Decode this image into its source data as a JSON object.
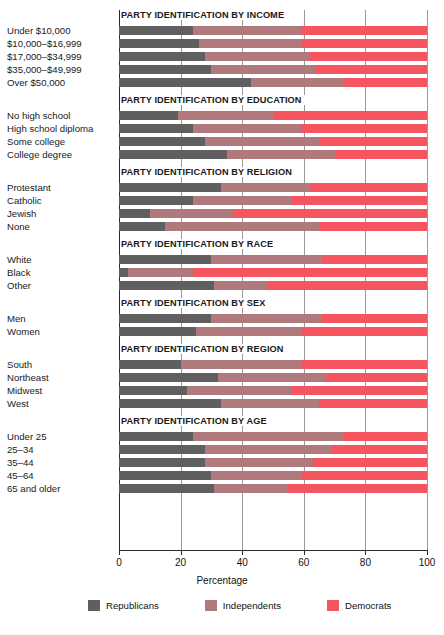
{
  "chart_data": {
    "type": "bar",
    "orientation": "horizontal",
    "stacked": true,
    "title": "",
    "xlabel": "Percentage",
    "ylabel": "",
    "xlim": [
      0,
      100
    ],
    "xticks": [
      0,
      20,
      40,
      60,
      80,
      100
    ],
    "xticklabels": [
      "0",
      "20",
      "40",
      "60",
      "80",
      "100"
    ],
    "grid": "vertical",
    "legend_position": "bottom",
    "legend": [
      "Republicans",
      "Independents",
      "Democrats"
    ],
    "colors": {
      "republicans": "#5f5f5f",
      "independents": "#b07a7d",
      "democrats": "#f4555f"
    },
    "series": [
      {
        "name": "Republicans",
        "key": "republicans"
      },
      {
        "name": "Independents",
        "key": "independents"
      },
      {
        "name": "Democrats",
        "key": "democrats"
      }
    ],
    "panels": [
      {
        "title": "PARTY IDENTIFICATION BY INCOME",
        "categories": [
          "Under $10,000",
          "$10,000–$16,999",
          "$17,000–$34,999",
          "$35,000–$49,999",
          "Over $50,000"
        ],
        "values": [
          {
            "republicans": 24,
            "independents": 35,
            "democrats": 41
          },
          {
            "republicans": 26,
            "independents": 33,
            "democrats": 41
          },
          {
            "republicans": 28,
            "independents": 34,
            "democrats": 38
          },
          {
            "republicans": 30,
            "independents": 34,
            "democrats": 36
          },
          {
            "republicans": 43,
            "independents": 30,
            "democrats": 27
          }
        ]
      },
      {
        "title": "PARTY IDENTIFICATION BY EDUCATION",
        "categories": [
          "No high school",
          "High school diploma",
          "Some college",
          "College degree"
        ],
        "values": [
          {
            "republicans": 19,
            "independents": 31,
            "democrats": 50
          },
          {
            "republicans": 24,
            "independents": 35,
            "democrats": 41
          },
          {
            "republicans": 28,
            "independents": 37,
            "democrats": 35
          },
          {
            "republicans": 35,
            "independents": 35,
            "democrats": 30
          }
        ]
      },
      {
        "title": "PARTY IDENTIFICATION BY RELIGION",
        "categories": [
          "Protestant",
          "Catholic",
          "Jewish",
          "None"
        ],
        "values": [
          {
            "republicans": 33,
            "independents": 29,
            "democrats": 38
          },
          {
            "republicans": 24,
            "independents": 32,
            "democrats": 44
          },
          {
            "republicans": 10,
            "independents": 27,
            "democrats": 63
          },
          {
            "republicans": 15,
            "independents": 50,
            "democrats": 35
          }
        ]
      },
      {
        "title": "PARTY IDENTIFICATION BY RACE",
        "categories": [
          "White",
          "Black",
          "Other"
        ],
        "values": [
          {
            "republicans": 30,
            "independents": 36,
            "democrats": 34
          },
          {
            "republicans": 3,
            "independents": 21,
            "democrats": 76
          },
          {
            "republicans": 31,
            "independents": 17,
            "democrats": 52
          }
        ]
      },
      {
        "title": "PARTY IDENTIFICATION BY SEX",
        "categories": [
          "Men",
          "Women"
        ],
        "values": [
          {
            "republicans": 30,
            "independents": 36,
            "democrats": 34
          },
          {
            "republicans": 25,
            "independents": 34,
            "democrats": 41
          }
        ]
      },
      {
        "title": "PARTY IDENTIFICATION BY REGION",
        "categories": [
          "South",
          "Northeast",
          "Midwest",
          "West"
        ],
        "values": [
          {
            "republicans": 20,
            "independents": 39,
            "democrats": 41
          },
          {
            "republicans": 32,
            "independents": 35,
            "democrats": 33
          },
          {
            "republicans": 22,
            "independents": 34,
            "democrats": 44
          },
          {
            "republicans": 33,
            "independents": 32,
            "democrats": 35
          }
        ]
      },
      {
        "title": "PARTY IDENTIFICATION BY AGE",
        "categories": [
          "Under 25",
          "25–34",
          "35–44",
          "45–64",
          "65 and older"
        ],
        "values": [
          {
            "republicans": 24,
            "independents": 49,
            "democrats": 27
          },
          {
            "republicans": 28,
            "independents": 41,
            "democrats": 31
          },
          {
            "republicans": 28,
            "independents": 35,
            "democrats": 37
          },
          {
            "republicans": 30,
            "independents": 29,
            "democrats": 41
          },
          {
            "republicans": 31,
            "independents": 24,
            "democrats": 45
          }
        ]
      }
    ]
  }
}
